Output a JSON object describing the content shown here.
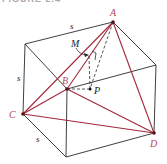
{
  "figure": {
    "header_partial": "FIGURE 2.4",
    "colors": {
      "cube_edge": "#2a2a2a",
      "tetra_edge": "#a3283c",
      "label_red": "#b4475a",
      "label_dark": "#222222",
      "vertex_dot": "#5a1018"
    },
    "labels": {
      "A": "A",
      "B": "B",
      "C": "C",
      "D": "D",
      "M": "M",
      "P": "P",
      "s_top": "s",
      "s_left": "s",
      "s_bottom": "s"
    }
  }
}
